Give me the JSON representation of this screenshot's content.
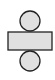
{
  "diagram": {
    "type": "cylinder-net",
    "colors": {
      "fill": "#e0e0e0",
      "stroke": "#222222",
      "background": "#ffffff"
    },
    "shapes": [
      {
        "kind": "circle",
        "role": "top-base",
        "cx": 30,
        "cy": 21,
        "r": 10
      },
      {
        "kind": "rect",
        "role": "lateral-surface",
        "x": 8,
        "y": 32,
        "width": 44,
        "height": 18
      },
      {
        "kind": "circle",
        "role": "bottom-base",
        "cx": 30,
        "cy": 61,
        "r": 10
      }
    ]
  }
}
